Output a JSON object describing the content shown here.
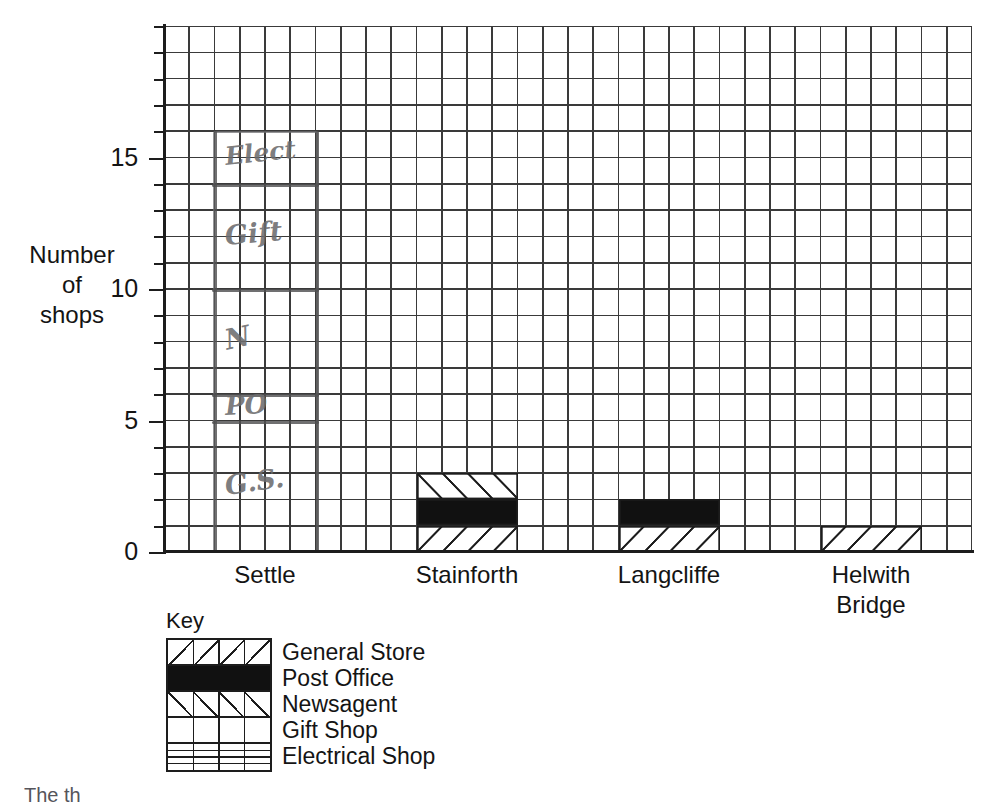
{
  "chart_data": {
    "type": "bar",
    "title": "",
    "subtitle": "",
    "xlabel": "",
    "ylabel": "Number of shops",
    "ylabel_lines": [
      "Number",
      "of",
      "shops"
    ],
    "categories": [
      "Settle",
      "Stainforth",
      "Langcliffe",
      "Helwith Bridge"
    ],
    "category_label_lines": [
      [
        "Settle"
      ],
      [
        "Stainforth"
      ],
      [
        "Langcliffe"
      ],
      [
        "Helwith",
        "Bridge"
      ]
    ],
    "ylim": [
      0,
      20
    ],
    "ytick_labels": [
      "0",
      "5",
      "10",
      "15"
    ],
    "ytick_values": [
      0,
      5,
      10,
      15
    ],
    "y_minor_step": 1,
    "grid": true,
    "grid_cols": 32,
    "grid_rows": 20,
    "stacked": true,
    "legend_position": "below-left",
    "series": [
      {
        "name": "General Store",
        "pattern": "diagonal-forward",
        "values": [
          5,
          1,
          1,
          1
        ]
      },
      {
        "name": "Post Office",
        "pattern": "solid-black",
        "values": [
          1,
          1,
          1,
          0
        ]
      },
      {
        "name": "Newsagent",
        "pattern": "diagonal-back",
        "values": [
          4,
          1,
          0,
          0
        ]
      },
      {
        "name": "Gift Shop",
        "pattern": "plain",
        "values": [
          4,
          0,
          0,
          0
        ]
      },
      {
        "name": "Electrical Shop",
        "pattern": "horizontal-lines",
        "values": [
          2,
          0,
          0,
          0
        ]
      }
    ],
    "totals": [
      16,
      3,
      2,
      1
    ],
    "annotations": [
      {
        "text": "Elect",
        "category": "Settle",
        "from": 14,
        "to": 16
      },
      {
        "text": "Gift",
        "category": "Settle",
        "from": 10,
        "to": 14
      },
      {
        "text": "N",
        "category": "Settle",
        "from": 6,
        "to": 10
      },
      {
        "text": "PO",
        "category": "Settle",
        "from": 5,
        "to": 6
      },
      {
        "text": "G.S.",
        "category": "Settle",
        "from": 0,
        "to": 5
      }
    ]
  },
  "key": {
    "title": "Key",
    "entries": [
      {
        "label": "General Store",
        "swatch": "diagonal-forward-hatch"
      },
      {
        "label": "Post Office",
        "swatch": "solid-black"
      },
      {
        "label": "Newsagent",
        "swatch": "diagonal-back-hatch"
      },
      {
        "label": "Gift Shop",
        "swatch": "plain-grid"
      },
      {
        "label": "Electrical Shop",
        "swatch": "horizontal-lines"
      }
    ]
  },
  "axis": {
    "ytick_labels": [
      "15",
      "10",
      "5",
      "0"
    ]
  },
  "footer": {
    "cutoff_text": "The th"
  },
  "colors": {
    "ink": "#1d1d1d",
    "grid": "#3a3a3a",
    "pencil": "#6e6e70",
    "background": "#ffffff"
  }
}
